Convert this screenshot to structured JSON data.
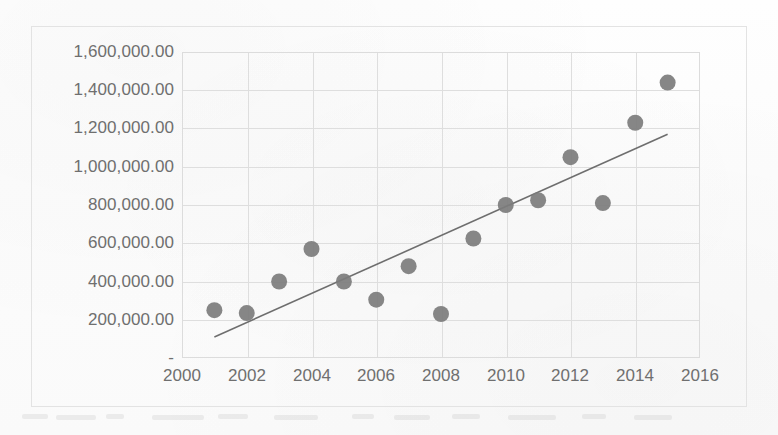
{
  "chart_data": {
    "type": "scatter",
    "title": "",
    "subtitle": "",
    "xlabel": "",
    "ylabel": "",
    "xlim": [
      2000,
      2016
    ],
    "ylim": [
      0,
      1600000
    ],
    "grid": true,
    "legend": false,
    "x_tick_labels": [
      "2000",
      "2002",
      "2004",
      "2006",
      "2008",
      "2010",
      "2012",
      "2014",
      "2016"
    ],
    "x_ticks": [
      2000,
      2002,
      2004,
      2006,
      2008,
      2010,
      2012,
      2014,
      2016
    ],
    "y_tick_labels": [
      "1,600,000.00",
      "1,400,000.00",
      "1,200,000.00",
      "1,000,000.00",
      "800,000.00",
      "600,000.00",
      "400,000.00",
      "200,000.00",
      "-"
    ],
    "y_ticks": [
      1600000,
      1400000,
      1200000,
      1000000,
      800000,
      600000,
      400000,
      200000,
      0
    ],
    "marker_color": "#7c7c7c",
    "trendline_color": "#6e6e6e",
    "gridline_color": "#dedede",
    "axis_label_color": "#6f6f6f",
    "series": [
      {
        "name": "Series 1",
        "x": [
          2001,
          2002,
          2003,
          2004,
          2005,
          2006,
          2007,
          2008,
          2009,
          2010,
          2011,
          2012,
          2013,
          2014,
          2015
        ],
        "y": [
          250000,
          235000,
          400000,
          570000,
          400000,
          305000,
          480000,
          230000,
          625000,
          800000,
          825000,
          1050000,
          810000,
          1230000,
          1440000
        ]
      }
    ],
    "trendline": {
      "type": "linear",
      "x_start": 2001,
      "y_start": 110000,
      "x_end": 2015,
      "y_end": 1170000
    }
  },
  "axes": {
    "y_label_top": "1,600,000.00",
    "zero_label": "-"
  }
}
